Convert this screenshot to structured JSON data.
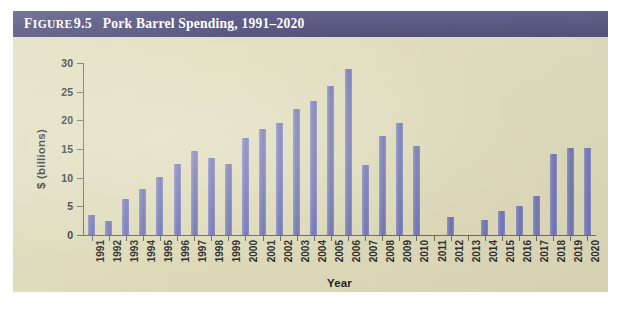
{
  "figure": {
    "label_word": "Figure",
    "label_word_cap": "F",
    "label_word_rest": "IGURE",
    "number": "9.5",
    "name": "Pork Barrel Spending, 1991–2020"
  },
  "colors": {
    "title_bar": "#4a4a77",
    "panel_background": "#e3dfbd",
    "bar": "#7c80bc",
    "axis": "#6d6a5c",
    "text": "#1f1f1f",
    "page_background": "#ffffff"
  },
  "chart_data": {
    "type": "bar",
    "title": "Pork Barrel Spending, 1991–2020",
    "xlabel": "Year",
    "ylabel": "$ (billions)",
    "ylim": [
      0,
      30
    ],
    "yticks": [
      0,
      5,
      10,
      15,
      20,
      25,
      30
    ],
    "ytick_labels": [
      "0",
      "5",
      "10",
      "15",
      "20",
      "25",
      "30"
    ],
    "grid": false,
    "legend": false,
    "categories": [
      "1991",
      "1992",
      "1993",
      "1994",
      "1995",
      "1996",
      "1997",
      "1998",
      "1999",
      "2000",
      "2001",
      "2002",
      "2003",
      "2004",
      "2005",
      "2006",
      "2007",
      "2008",
      "2009",
      "2010",
      "2011",
      "2012",
      "2013",
      "2014",
      "2015",
      "2016",
      "2017",
      "2018",
      "2019",
      "2020"
    ],
    "values": [
      3.5,
      2.5,
      6.2,
      8.0,
      10.1,
      12.3,
      14.6,
      13.5,
      12.4,
      17.0,
      18.5,
      19.6,
      22.0,
      23.4,
      26.0,
      29.0,
      12.2,
      17.2,
      19.6,
      15.6,
      0,
      3.2,
      0,
      2.7,
      4.2,
      5.0,
      6.8,
      14.1,
      15.2,
      15.2
    ]
  }
}
